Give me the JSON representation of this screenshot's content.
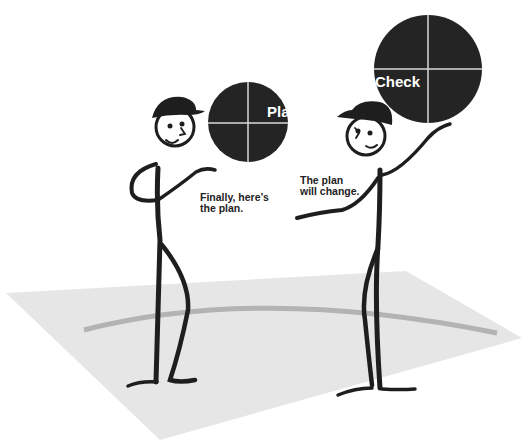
{
  "illustration": {
    "colors": {
      "background": "#ffffff",
      "floor": "#e6e6e6",
      "floor_arc": "#b3b3b3",
      "figure": "#1e1e1e",
      "circle": "#242424",
      "circle_divider": "#d8d8d8",
      "circle_text": "#ffffff"
    },
    "figures": [
      {
        "id": "left",
        "circle_label": "Plan",
        "caption_line1": "Finally, here’s",
        "caption_line2": "the plan."
      },
      {
        "id": "right",
        "circle_label": "Check",
        "caption_line1": "The plan",
        "caption_line2": "will change."
      }
    ]
  }
}
